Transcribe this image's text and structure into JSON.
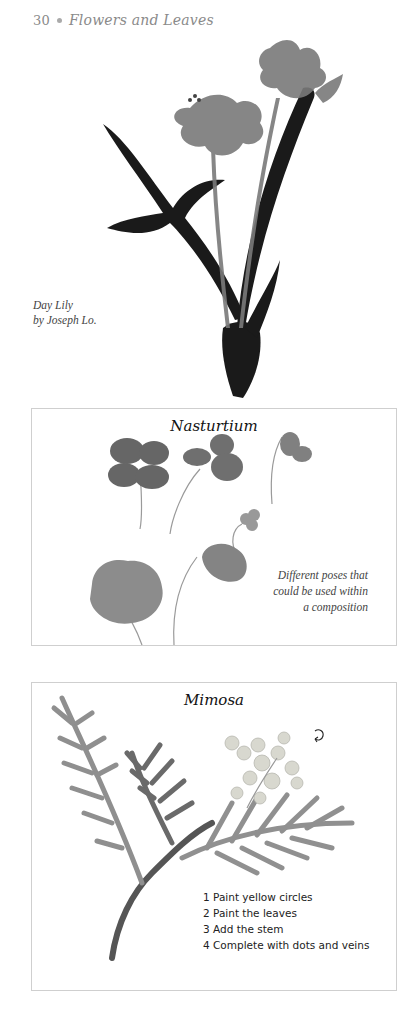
{
  "page": {
    "number": "30",
    "running_head": "Flowers and Leaves"
  },
  "day_lily": {
    "caption_line1": "Day Lily",
    "caption_line2": "by Joseph Lo."
  },
  "nasturtium": {
    "title": "Nasturtium",
    "caption": [
      "Different poses that",
      "could be used within",
      "a composition"
    ]
  },
  "mimosa": {
    "title": "Mimosa",
    "steps": [
      "1 Paint yellow circles",
      "2 Paint the leaves",
      "3 Add the stem",
      "4 Complete with dots and veins"
    ],
    "rotate_icon": "rotate-arrow-icon"
  },
  "colors": {
    "panel_border": "#cfcfcf",
    "ink_dark": "#1a1a1a",
    "ink_mid": "#6e6e6e",
    "ink_light": "#a8a8a8",
    "flower_pale": "#d8d8cf"
  }
}
